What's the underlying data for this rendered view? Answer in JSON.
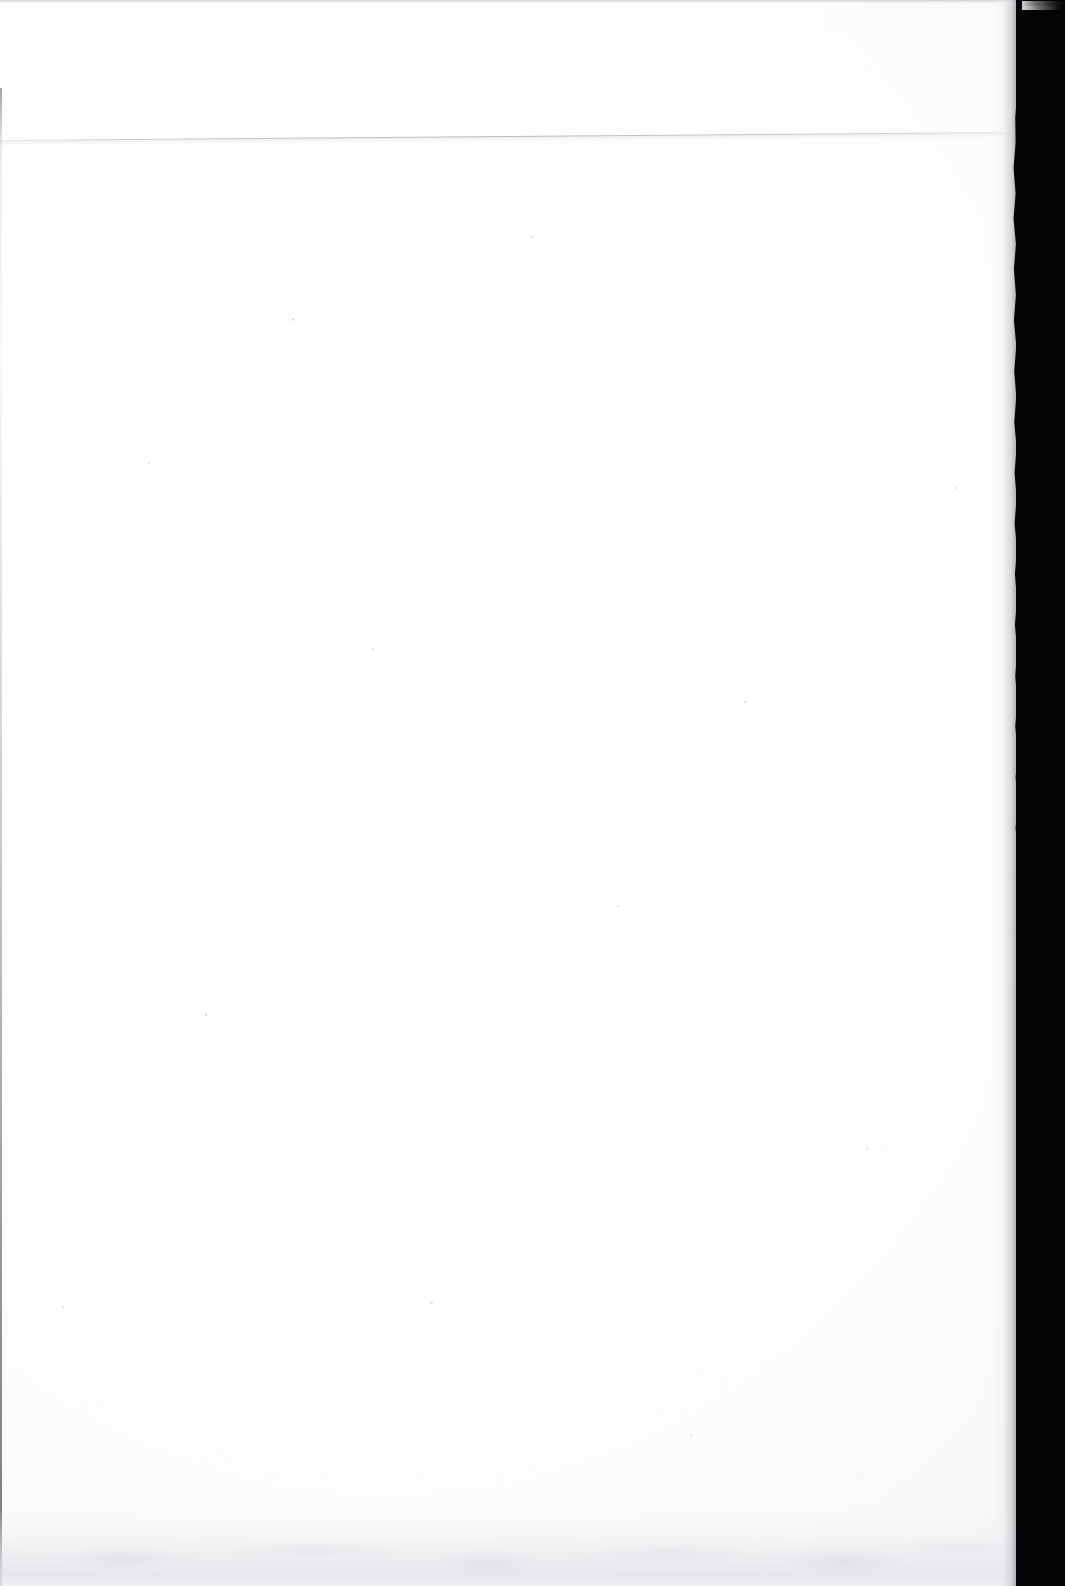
{
  "document": {
    "type": "scanned-page",
    "content_description": "Blank page",
    "visible_text": "",
    "page_number": "",
    "caption": "Blank scanned page with black scanner backdrop at right edge"
  },
  "canvas": {
    "width_px": 1065,
    "height_px": 1586
  },
  "colors": {
    "paper": "#fdfdfd",
    "paper_shade": "#f1f1f3",
    "backdrop": "#050505",
    "edge_line": "#b0b3bb",
    "smudge": "#dedfe4"
  },
  "regions": {
    "paper_sheet": {
      "name": "paper-sheet",
      "left_px": 0,
      "top_px": 0,
      "width_px": 1016,
      "height_px": 1586
    },
    "scanner_backdrop": {
      "name": "scanner-backdrop",
      "left_px": 1016,
      "top_px": 0,
      "width_px": 49,
      "height_px": 1586
    }
  },
  "artifacts": {
    "top_edge_band": {
      "name": "top-edge-band",
      "top_px": 0,
      "height_px": 4
    },
    "underlying_sheet_edge": {
      "name": "underlying-sheet-edge",
      "left_y_px": 140,
      "right_y_px": 132,
      "description": "faint slanted rule across the page"
    },
    "left_margin_line": {
      "name": "left-margin-line",
      "left_px": 0,
      "top_px": 88,
      "width_px": 2
    },
    "bottom_smudge": {
      "name": "bottom-smudge",
      "top_px": 1508,
      "height_px": 78,
      "description": "faint grey shadow band along the bottom"
    },
    "corner_streak": {
      "name": "corner-streak-artifact",
      "left_px": 1022,
      "top_px": 1,
      "description": "bright scanner streak over the black backdrop"
    }
  }
}
